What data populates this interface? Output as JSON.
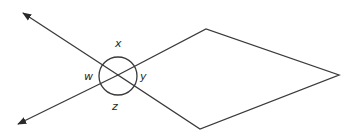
{
  "diagram": {
    "type": "geometry",
    "angle_labels": {
      "x": "x",
      "y": "y",
      "w": "w",
      "z": "z"
    },
    "intersection": [
      118,
      75
    ],
    "kite_vertices": [
      [
        118,
        75
      ],
      [
        206,
        29
      ],
      [
        339,
        75
      ],
      [
        200,
        129
      ]
    ],
    "arrow_tips": [
      [
        22,
        12
      ],
      [
        17,
        125
      ]
    ],
    "stroke_color": "#3a3a3a"
  }
}
